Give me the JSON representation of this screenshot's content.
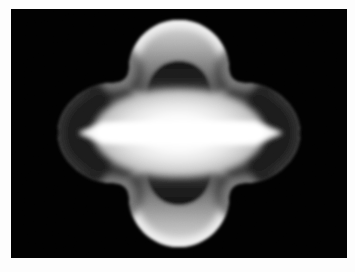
{
  "figure": {
    "alt_text": "Grayscale scientific visualization: a black rectangular canvas containing a bright four-lobed clover-shaped field with a hot horizontal bar through its center.",
    "canvas": {
      "background_color": "#010101",
      "page_background_color": "#fdfdfd",
      "left": 11,
      "top": 9,
      "width": 336,
      "height": 249
    }
  },
  "chart_data": {
    "type": "heatmap",
    "subtitle": "",
    "xlabel": "",
    "ylabel": "",
    "colormap": "gray",
    "grid": false,
    "legend": "none",
    "axis_visible": false,
    "tick_labels": [],
    "background_value": 0,
    "xlim": [
      0,
      336
    ],
    "ylim": [
      0,
      249
    ],
    "center": {
      "x": 168,
      "y": 124
    },
    "value_range": [
      0.0,
      1.0
    ],
    "lobes": {
      "count": 4,
      "orientation_degrees": [
        0,
        90,
        180,
        270
      ],
      "outer_radius": 120,
      "waist_radius": 74,
      "vertical_extent": [
        11,
        238
      ],
      "horizontal_extent": [
        44,
        289
      ]
    },
    "inner_void": {
      "shape": "four-lobed",
      "radius": 62,
      "value_min": 0.05,
      "value_max": 0.62
    },
    "hot_bar": {
      "orientation": "horizontal",
      "x_extent": [
        67,
        272
      ],
      "y_extent": [
        112,
        136
      ],
      "peak_value": 1.0,
      "end_shape": "pointed"
    },
    "rim": {
      "value_min": 0.55,
      "value_max": 0.97,
      "thickness": 38
    },
    "samples": [
      {
        "label": "center",
        "x": 168,
        "y": 124,
        "value": 1.0
      },
      {
        "label": "bar-left-tip",
        "x": 67,
        "y": 124,
        "value": 0.93
      },
      {
        "label": "bar-right-tip",
        "x": 272,
        "y": 124,
        "value": 0.93
      },
      {
        "label": "top-lobe-crest",
        "x": 168,
        "y": 20,
        "value": 0.95
      },
      {
        "label": "bottom-lobe-crest",
        "x": 168,
        "y": 230,
        "value": 0.95
      },
      {
        "label": "left-lobe-crest",
        "x": 52,
        "y": 124,
        "value": 0.3
      },
      {
        "label": "right-lobe-crest",
        "x": 284,
        "y": 124,
        "value": 0.3
      },
      {
        "label": "inner-void-top",
        "x": 168,
        "y": 62,
        "value": 0.08
      },
      {
        "label": "inner-void-bottom",
        "x": 168,
        "y": 190,
        "value": 0.08
      },
      {
        "label": "diagonal-waist",
        "x": 100,
        "y": 62,
        "value": 0.18
      },
      {
        "label": "corner-background",
        "x": 20,
        "y": 20,
        "value": 0.0
      }
    ],
    "gray_stops": [
      {
        "stop": 0.0,
        "hex": "#000000"
      },
      {
        "stop": 0.1,
        "hex": "#151515"
      },
      {
        "stop": 0.25,
        "hex": "#3a3a3a"
      },
      {
        "stop": 0.45,
        "hex": "#6e6e6e"
      },
      {
        "stop": 0.65,
        "hex": "#a6a6a6"
      },
      {
        "stop": 0.82,
        "hex": "#d2d2d2"
      },
      {
        "stop": 0.93,
        "hex": "#ededed"
      },
      {
        "stop": 1.0,
        "hex": "#ffffff"
      }
    ]
  }
}
